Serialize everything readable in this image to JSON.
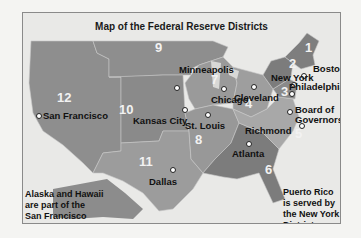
{
  "title": "Map of the Federal Reserve Districts",
  "districts": [
    {
      "number": "1",
      "city": "Boston"
    },
    {
      "number": "2",
      "city": "New York"
    },
    {
      "number": "3",
      "city": "Philadelphia"
    },
    {
      "number": "4",
      "city": "Cleveland"
    },
    {
      "number": "5",
      "city": "Richmond"
    },
    {
      "number": "6",
      "city": "Atlanta"
    },
    {
      "number": "7",
      "city": "Chicago"
    },
    {
      "number": "8",
      "city": "St. Louis"
    },
    {
      "number": "9",
      "city": "Minneapolis"
    },
    {
      "number": "10",
      "city": "Kansas City"
    },
    {
      "number": "11",
      "city": "Dallas"
    },
    {
      "number": "12",
      "city": "San Francisco"
    }
  ],
  "board": {
    "line1": "Board of",
    "line2": "Governors"
  },
  "notes": {
    "alaska_hawaii": [
      "Alaska and Hawaii",
      "are part of the",
      "San Francisco",
      "District"
    ],
    "puerto_rico": [
      "Puerto Rico",
      "is served by",
      "the New York",
      "District"
    ]
  },
  "colors": {
    "background": "#e9e9e7",
    "land_light": "#9a9a9a",
    "land_mid": "#8a8a8a",
    "land_dark": "#7a7a7a"
  }
}
